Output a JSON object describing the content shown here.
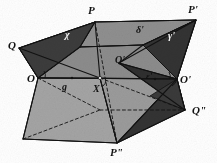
{
  "figure": {
    "background_color": "#ffffff",
    "stroke_color": "#121212",
    "palette": {
      "dark": "#3c3c3c",
      "dark_alt": "#333333",
      "mid": "#8c8c8c",
      "mid_light": "#959595",
      "light": "#a4a4a4",
      "light_alt": "#9b9b9b",
      "white_text": "#f2f2f2",
      "black_text": "#111111"
    },
    "labels": [
      {
        "id": "P",
        "text": "P",
        "prime": "",
        "x": 88,
        "y": 5,
        "size": "sz-lg",
        "tone": "lbl-dark"
      },
      {
        "id": "P-prime",
        "text": "P",
        "prime": "'",
        "x": 188,
        "y": 4,
        "size": "sz-lg",
        "tone": "lbl-dark"
      },
      {
        "id": "Q",
        "text": "Q",
        "prime": "",
        "x": 8,
        "y": 40,
        "size": "sz-lg",
        "tone": "lbl-dark"
      },
      {
        "id": "chi",
        "text": "χ",
        "prime": "",
        "x": 65,
        "y": 30,
        "size": "sz-md",
        "tone": "lbl-light"
      },
      {
        "id": "delta-pr",
        "text": "δ",
        "prime": "'",
        "x": 136,
        "y": 25,
        "size": "sz-md",
        "tone": "lbl-dark"
      },
      {
        "id": "gamma-pr",
        "text": "γ",
        "prime": "'",
        "x": 168,
        "y": 31,
        "size": "sz-md",
        "tone": "lbl-light"
      },
      {
        "id": "Q-prime",
        "text": "Q",
        "prime": "'",
        "x": 115,
        "y": 55,
        "size": "sz-md",
        "tone": "lbl-dark"
      },
      {
        "id": "O",
        "text": "O",
        "prime": "",
        "x": 27,
        "y": 73,
        "size": "sz-lg",
        "tone": "lbl-dark"
      },
      {
        "id": "g",
        "text": "g",
        "prime": "",
        "x": 62,
        "y": 82,
        "size": "sz-md",
        "tone": "lbl-dark"
      },
      {
        "id": "X",
        "text": "X",
        "prime": "",
        "x": 93,
        "y": 84,
        "size": "sz-md",
        "tone": "lbl-dark"
      },
      {
        "id": "eps-pr",
        "text": "ε",
        "prime": "'",
        "x": 146,
        "y": 72,
        "size": "sz-sm",
        "tone": "lbl-dark"
      },
      {
        "id": "O-prime",
        "text": "O",
        "prime": "'",
        "x": 180,
        "y": 74,
        "size": "sz-lg",
        "tone": "lbl-dark"
      },
      {
        "id": "Q-dprime",
        "text": "Q",
        "prime": "\"",
        "x": 192,
        "y": 105,
        "size": "sz-lg",
        "tone": "lbl-dark"
      },
      {
        "id": "P-dprime",
        "text": "P",
        "prime": "\"",
        "x": 110,
        "y": 147,
        "size": "sz-lg",
        "tone": "lbl-dark"
      }
    ],
    "vertices": {
      "P": {
        "x": 95,
        "y": 22
      },
      "P_prime": {
        "x": 196,
        "y": 20
      },
      "Q": {
        "x": 19,
        "y": 48
      },
      "Q_prime": {
        "x": 119,
        "y": 63
      },
      "Q_dprime": {
        "x": 185,
        "y": 110
      },
      "O": {
        "x": 38,
        "y": 78
      },
      "O_prime": {
        "x": 177,
        "y": 79
      },
      "X": {
        "x": 100,
        "y": 78
      },
      "P_dprime": {
        "x": 117,
        "y": 143
      },
      "bottom_left": {
        "x": 23,
        "y": 139
      },
      "upper_mid": {
        "x": 143,
        "y": 45
      }
    },
    "faces": [
      {
        "id": "upper-left-wedge",
        "tone": "dark"
      },
      {
        "id": "upper-top-band",
        "tone": "mid_light"
      },
      {
        "id": "upper-right-wedge",
        "tone": "dark_alt"
      },
      {
        "id": "central-quad",
        "tone": "mid"
      },
      {
        "id": "lower-left-panel",
        "tone": "light"
      },
      {
        "id": "lower-right-wedge",
        "tone": "dark_alt"
      },
      {
        "id": "lower-mid-panel",
        "tone": "light_alt"
      }
    ]
  }
}
